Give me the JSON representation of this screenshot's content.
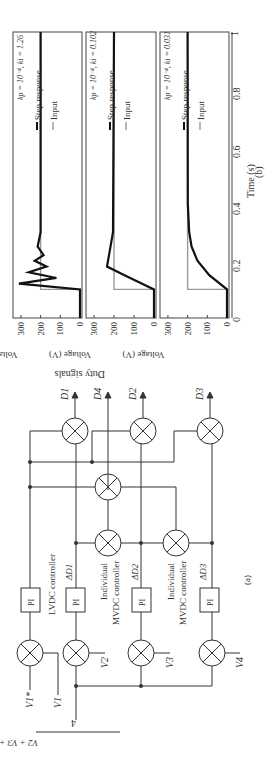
{
  "figure": {
    "part_a_label": "(a)",
    "part_b_label": "(b)",
    "duty_signals_label": "Duty signals",
    "lvdc_controller_label": "LVDC controller",
    "mvdc_controller_label_1": "Individual",
    "mvdc_controller_label_2": "MVDC controller",
    "pi_label": "PI",
    "inputs": [
      "V1*",
      "V1",
      "V2",
      "V3",
      "V4"
    ],
    "average_expr_numerator": "V2 + V3 + V4 + V5",
    "average_expr_denominator": "4",
    "delta_labels": [
      "ΔD1",
      "ΔD2",
      "ΔD3"
    ],
    "outputs": [
      "D1",
      "D4",
      "D2",
      "D3"
    ],
    "sum_signs": {
      "plus": "+",
      "minus": "−"
    }
  },
  "chart_data": [
    {
      "type": "line",
      "title": "kp = 10^-4, ki = 1.26",
      "xlabel": "Time (s)",
      "ylabel": "Voltage (V)",
      "xlim": [
        0,
        1
      ],
      "ylim": [
        0,
        330
      ],
      "xticks": [
        0,
        0.2,
        0.4,
        0.6,
        0.8,
        1
      ],
      "yticks": [
        0,
        100,
        200,
        300
      ],
      "legend": [
        "Step response",
        "Input"
      ],
      "series": [
        {
          "name": "Input",
          "x": [
            0,
            0.1,
            0.1,
            1
          ],
          "y": [
            0,
            0,
            200,
            200
          ]
        },
        {
          "name": "Step response",
          "x": [
            0,
            0.1,
            0.12,
            0.14,
            0.16,
            0.18,
            0.2,
            0.22,
            0.25,
            0.3,
            1
          ],
          "y": [
            0,
            0,
            310,
            120,
            260,
            170,
            230,
            185,
            215,
            200,
            200
          ]
        }
      ]
    },
    {
      "type": "line",
      "title": "kp = 10^-4, ki = 0.102",
      "xlabel": "Time (s)",
      "ylabel": "Voltage (V)",
      "xlim": [
        0,
        1
      ],
      "ylim": [
        0,
        330
      ],
      "xticks": [
        0,
        0.2,
        0.4,
        0.6,
        0.8,
        1
      ],
      "yticks": [
        0,
        100,
        200,
        300
      ],
      "legend": [
        "Step response",
        "Input"
      ],
      "series": [
        {
          "name": "Input",
          "x": [
            0,
            0.1,
            0.1,
            1
          ],
          "y": [
            0,
            0,
            200,
            200
          ]
        },
        {
          "name": "Step response",
          "x": [
            0,
            0.1,
            0.15,
            0.18,
            0.22,
            0.3,
            1
          ],
          "y": [
            0,
            0,
            150,
            235,
            225,
            205,
            200
          ]
        }
      ]
    },
    {
      "type": "line",
      "title": "kp = 10^-4, ki = 0.031",
      "xlabel": "Time (s)",
      "ylabel": "Voltage (V)",
      "xlim": [
        0,
        1
      ],
      "ylim": [
        0,
        330
      ],
      "xticks": [
        0,
        0.2,
        0.4,
        0.6,
        0.8,
        1
      ],
      "yticks": [
        0,
        100,
        200,
        300
      ],
      "legend": [
        "Step response",
        "Input"
      ],
      "series": [
        {
          "name": "Input",
          "x": [
            0,
            0.1,
            0.1,
            1
          ],
          "y": [
            0,
            0,
            200,
            200
          ]
        },
        {
          "name": "Step response",
          "x": [
            0,
            0.1,
            0.15,
            0.2,
            0.25,
            0.3,
            0.4,
            1
          ],
          "y": [
            0,
            0,
            90,
            150,
            180,
            192,
            199,
            200
          ]
        }
      ]
    }
  ]
}
